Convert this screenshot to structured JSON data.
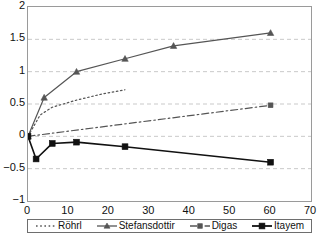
{
  "chart_data": {
    "type": "line",
    "title": "",
    "xlabel": "",
    "ylabel": "",
    "xlim": [
      0,
      70
    ],
    "ylim": [
      -1,
      2
    ],
    "xticks": [
      0,
      10,
      20,
      30,
      40,
      50,
      60,
      70
    ],
    "yticks": [
      2,
      1.5,
      1,
      0.5,
      0,
      -0.5,
      -1
    ],
    "xtick_labels": [
      "0",
      "10",
      "20",
      "30",
      "40",
      "50",
      "60",
      "70"
    ],
    "ytick_labels": [
      "2",
      "1.5",
      "1",
      "0.5",
      "0",
      "−0.5",
      "−1"
    ],
    "grid": {
      "horizontal": true,
      "vertical": false,
      "style": "dashed",
      "color": "#c9c9c9",
      "levels": [
        1.5,
        1,
        0.5,
        0,
        -0.5
      ]
    },
    "legend": {
      "position": "below-axis",
      "entries": [
        "Röhrl",
        "Stefansdottir",
        "Digas",
        "Itayem"
      ]
    },
    "series": [
      {
        "name": "Röhrl",
        "color": "#555555",
        "line_style": "dotted",
        "marker": "none",
        "x": [
          0,
          3,
          6,
          12,
          18,
          24
        ],
        "values": [
          0,
          0.33,
          0.45,
          0.56,
          0.65,
          0.72
        ]
      },
      {
        "name": "Stefansdottir",
        "color": "#555555",
        "line_style": "solid",
        "marker": "triangle",
        "x": [
          0,
          4,
          12,
          24,
          36,
          60
        ],
        "values": [
          0,
          0.6,
          1.0,
          1.2,
          1.4,
          1.6
        ]
      },
      {
        "name": "Digas",
        "color": "#555555",
        "line_style": "dash-dot",
        "marker": "square",
        "x": [
          0,
          60
        ],
        "values": [
          0,
          0.48
        ]
      },
      {
        "name": "Itayem",
        "color": "#111111",
        "line_style": "solid",
        "marker": "filled-square",
        "x": [
          0,
          2,
          6,
          12,
          24,
          60
        ],
        "values": [
          0,
          -0.35,
          -0.11,
          -0.09,
          -0.16,
          -0.4
        ]
      }
    ]
  },
  "legend": {
    "entries": [
      {
        "label": "Röhrl",
        "swatch": "dotted-line-swatch"
      },
      {
        "label": "Stefansdottir",
        "swatch": "solid-triangle-line-swatch"
      },
      {
        "label": "Digas",
        "swatch": "dashdot-square-line-swatch"
      },
      {
        "label": "Itayem",
        "swatch": "solid-square-line-swatch"
      }
    ]
  }
}
